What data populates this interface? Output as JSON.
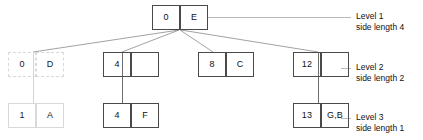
{
  "diagram": {
    "type": "tree",
    "ink_color": "#4a4a4a",
    "faint_color": "#d9d9d9",
    "text_color": "#111111",
    "nodes": [
      {
        "id": "root",
        "level": 1,
        "key": "0",
        "value": "E",
        "style": "solid"
      },
      {
        "id": "n-0-d",
        "level": 2,
        "key": "0",
        "value": "D",
        "style": "faint"
      },
      {
        "id": "n-4",
        "level": 2,
        "key": "4",
        "value": "",
        "style": "solid"
      },
      {
        "id": "n-8-c",
        "level": 2,
        "key": "8",
        "value": "C",
        "style": "solid"
      },
      {
        "id": "n-12",
        "level": 2,
        "key": "12",
        "value": "",
        "style": "solid"
      },
      {
        "id": "n-1-a",
        "level": 3,
        "key": "1",
        "value": "A",
        "style": "faint"
      },
      {
        "id": "n-4-f",
        "level": 3,
        "key": "4",
        "value": "F",
        "style": "solid"
      },
      {
        "id": "n-13-gb",
        "level": 3,
        "key": "13",
        "value": "G,B",
        "style": "solid"
      }
    ],
    "levels": [
      {
        "name": "Level 1",
        "side": "side length 4"
      },
      {
        "name": "Level 2",
        "side": "side length 2"
      },
      {
        "name": "Level 3",
        "side": "side length 1"
      }
    ]
  }
}
